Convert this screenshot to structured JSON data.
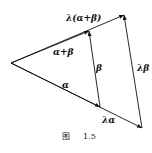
{
  "figure": {
    "caption_prefix": "图",
    "caption_number": "1.5",
    "points": {
      "O": [
        11,
        63
      ],
      "alpha_end": [
        100,
        107
      ],
      "alpha_plus_beta_end": [
        89,
        31
      ],
      "lambda_alpha_end": [
        142,
        128
      ],
      "lambda_alpha_plus_beta_end": [
        124,
        15
      ]
    },
    "labels": {
      "lambda_alpha_plus_beta": "λ(α+β)",
      "alpha_plus_beta": "α+β",
      "beta": "β",
      "lambda_beta": "λβ",
      "alpha": "α",
      "lambda_alpha": "λα"
    },
    "colors": {
      "stroke": "#111111",
      "background": "#ffffff"
    }
  }
}
